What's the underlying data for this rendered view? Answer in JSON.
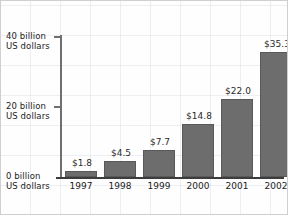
{
  "chart_data": {
    "type": "bar",
    "title": "",
    "xlabel": "",
    "ylabel": "billion US dollars",
    "categories": [
      "1997",
      "1998",
      "1999",
      "2000",
      "2001",
      "2002"
    ],
    "values": [
      1.8,
      4.5,
      7.7,
      14.8,
      22.0,
      35.3
    ],
    "value_labels": [
      "$1.8",
      "$4.5",
      "$7.7",
      "$14.8",
      "$22.0",
      "$35.3"
    ],
    "ylim": [
      0,
      40
    ],
    "yticks": [
      0,
      20,
      40
    ],
    "ytick_labels": [
      {
        "line1": "0 billion",
        "line2": "US dollars"
      },
      {
        "line1": "20 billion",
        "line2": "US dollars"
      },
      {
        "line1": "40 billion",
        "line2": "US dollars"
      }
    ],
    "grid": true,
    "legend": "none",
    "bar_color": "#6d6d6d",
    "shadow_color": "#c9c9c9",
    "axis_color": "#3c3c3c"
  }
}
